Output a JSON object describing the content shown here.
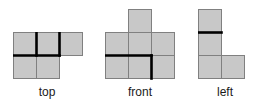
{
  "page": {
    "background_color": "#ffffff",
    "width": 259,
    "height": 106
  },
  "style": {
    "cell_fill": "#c8c8c8",
    "thin_line_color": "#808080",
    "thick_line_color": "#000000",
    "thin_line_width": 1,
    "thick_line_width": 2.6,
    "cell_size": 23,
    "label_color": "#1a1a1a"
  },
  "figures": [
    {
      "id": "top-view",
      "label": "top",
      "origin": {
        "x": 13,
        "y": 32
      },
      "cells": [
        {
          "col": 0,
          "row": 0
        },
        {
          "col": 1,
          "row": 0
        },
        {
          "col": 2,
          "row": 0
        },
        {
          "col": 0,
          "row": 1
        },
        {
          "col": 1,
          "row": 1
        }
      ],
      "thick_segments": [
        {
          "type": "horizontal",
          "col": 0,
          "row": 1
        },
        {
          "type": "horizontal",
          "col": 1,
          "row": 1
        },
        {
          "type": "vertical",
          "col": 1,
          "row": 0
        },
        {
          "type": "vertical",
          "col": 2,
          "row": 0
        }
      ]
    },
    {
      "id": "front-view",
      "label": "front",
      "origin": {
        "x": 105,
        "y": 9
      },
      "cells": [
        {
          "col": 1,
          "row": 0
        },
        {
          "col": 0,
          "row": 1
        },
        {
          "col": 1,
          "row": 1
        },
        {
          "col": 2,
          "row": 1
        },
        {
          "col": 0,
          "row": 2
        },
        {
          "col": 1,
          "row": 2
        },
        {
          "col": 2,
          "row": 2
        }
      ],
      "thick_segments": [
        {
          "type": "horizontal",
          "col": 0,
          "row": 2
        },
        {
          "type": "horizontal",
          "col": 1,
          "row": 2
        },
        {
          "type": "vertical",
          "col": 2,
          "row": 2
        }
      ]
    },
    {
      "id": "left-view",
      "label": "left",
      "origin": {
        "x": 198,
        "y": 9
      },
      "cells": [
        {
          "col": 0,
          "row": 0
        },
        {
          "col": 0,
          "row": 1
        },
        {
          "col": 0,
          "row": 2
        },
        {
          "col": 1,
          "row": 2
        }
      ],
      "thick_segments": [
        {
          "type": "horizontal",
          "col": 0,
          "row": 1
        }
      ]
    }
  ]
}
